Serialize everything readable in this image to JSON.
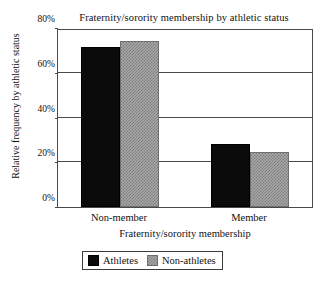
{
  "chart_data": {
    "type": "bar",
    "title": "Fraternity/sorority membership by athletic status",
    "xlabel": "Fraternity/sorority membership",
    "ylabel": "Relative frequency by athletic status",
    "categories": [
      "Non-member",
      "Member"
    ],
    "series": [
      {
        "name": "Athletes",
        "values": [
          71.5,
          28.0
        ],
        "color": "#0b0b0b"
      },
      {
        "name": "Non-athletes",
        "values": [
          74.0,
          24.5
        ],
        "color": "#a8a8a8"
      }
    ],
    "ylim": [
      0,
      80
    ],
    "yticks": [
      0,
      20,
      40,
      60,
      80
    ],
    "ytick_labels": [
      "0%",
      "20%",
      "40%",
      "60%",
      "80%"
    ],
    "grid": true,
    "legend_position": "bottom-center"
  }
}
